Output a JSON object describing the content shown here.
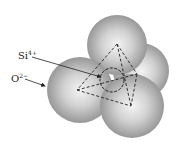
{
  "diagram": {
    "labels": {
      "silicon_ion": {
        "base": "Si",
        "charge": "4+"
      },
      "oxygen_ion": {
        "base": "O",
        "charge": "2−"
      }
    },
    "colors": {
      "sphere_dark": "#8a8a8a",
      "sphere_light": "#f2f2f2",
      "line": "#222222"
    }
  }
}
